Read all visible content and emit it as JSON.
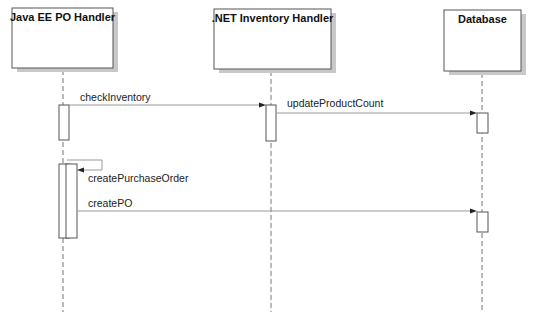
{
  "diagram": {
    "type": "sequence",
    "participants": [
      {
        "id": "javaee",
        "name": "Java EE PO Handler"
      },
      {
        "id": "dotnet",
        "name": ".NET Inventory Handler"
      },
      {
        "id": "db",
        "name": "Database"
      }
    ],
    "messages": [
      {
        "from": "javaee",
        "to": "dotnet",
        "label": "checkInventory"
      },
      {
        "from": "dotnet",
        "to": "db",
        "label": "updateProductCount"
      },
      {
        "from": "javaee",
        "to": "javaee",
        "label": "createPurchaseOrder"
      },
      {
        "from": "javaee",
        "to": "db",
        "label": "createPO"
      }
    ],
    "colors": {
      "line": "#555555",
      "lifeline": "#777777",
      "box_fill": "#ffffff",
      "shadow": "#c8c8c8",
      "message_line": "#999999"
    }
  }
}
